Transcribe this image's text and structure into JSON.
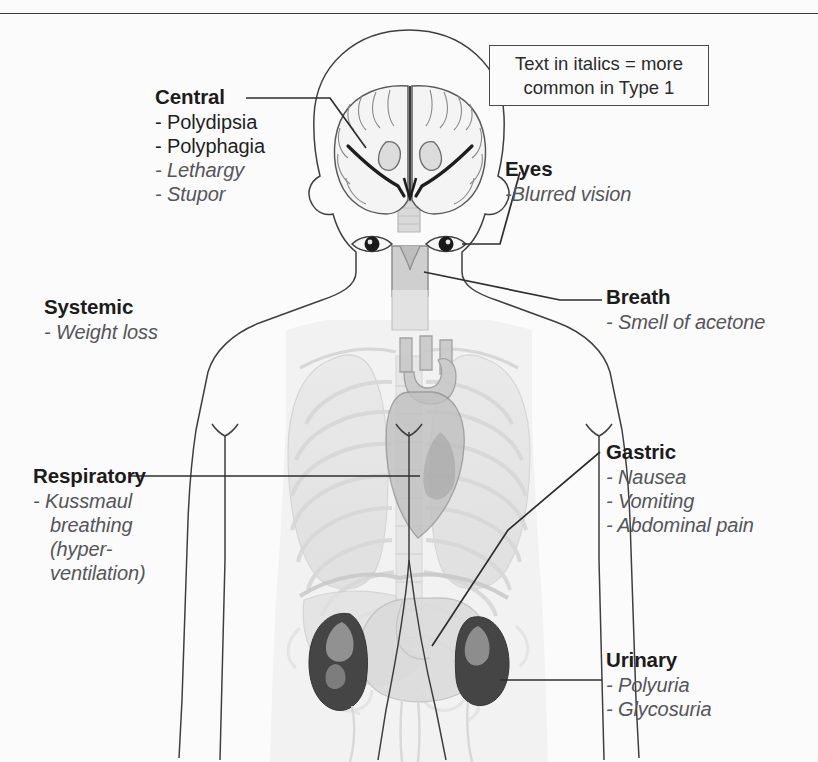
{
  "figure": {
    "background_color": "#fbfbfb",
    "line_color": "#3a3a3a",
    "heading_color": "#1c1c1c",
    "italic_color": "#55555a"
  },
  "legend": {
    "line1": "Text in italics = more",
    "line2": "common in Type 1"
  },
  "callouts": {
    "central": {
      "heading": "Central",
      "items": [
        {
          "text": "- Polydipsia",
          "italic": false
        },
        {
          "text": "- Polyphagia",
          "italic": false
        },
        {
          "text": "- Lethargy",
          "italic": true
        },
        {
          "text": "- Stupor",
          "italic": true
        }
      ]
    },
    "eyes": {
      "heading": "Eyes",
      "items": [
        {
          "text": "-Blurred vision",
          "italic": true
        }
      ]
    },
    "breath": {
      "heading": "Breath",
      "items": [
        {
          "text": "- Smell of acetone",
          "italic": true
        }
      ]
    },
    "systemic": {
      "heading": "Systemic",
      "items": [
        {
          "text": "- Weight loss",
          "italic": true
        }
      ]
    },
    "respiratory": {
      "heading": "Respiratory",
      "items": [
        {
          "text": "- Kussmaul",
          "italic": true
        },
        {
          "text": "breathing",
          "italic": true
        },
        {
          "text": "(hyper-",
          "italic": true
        },
        {
          "text": "ventilation)",
          "italic": true
        }
      ]
    },
    "gastric": {
      "heading": "Gastric",
      "items": [
        {
          "text": "- Nausea",
          "italic": true
        },
        {
          "text": "- Vomiting",
          "italic": true
        },
        {
          "text": "- Abdominal pain",
          "italic": true
        }
      ]
    },
    "urinary": {
      "heading": "Urinary",
      "items": [
        {
          "text": "- Polyuria",
          "italic": true
        },
        {
          "text": "- Glycosuria",
          "italic": true
        }
      ]
    }
  },
  "anatomy": {
    "parts": [
      "head-outline",
      "brain-coronal-section",
      "left-eye",
      "right-eye",
      "neck",
      "trachea",
      "larynx",
      "torso-outline",
      "left-arm",
      "right-arm",
      "ribcage",
      "left-lung",
      "right-lung",
      "heart",
      "spine",
      "diaphragm",
      "stomach",
      "left-kidney",
      "right-kidney",
      "ureters",
      "intestines",
      "legs"
    ]
  }
}
